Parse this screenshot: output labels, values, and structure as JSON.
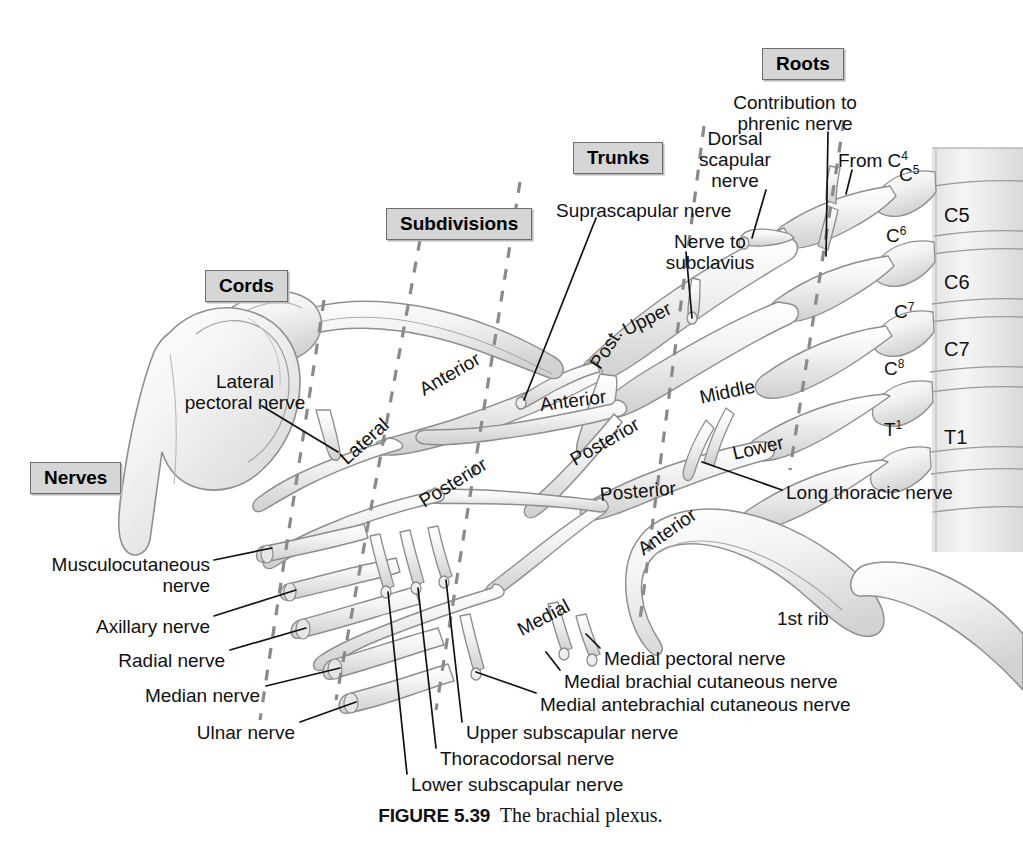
{
  "figure": {
    "number": "FIGURE 5.39",
    "title": "The brachial plexus.",
    "colors": {
      "box_fill": "#d6d6d6",
      "box_border": "#6e6e6e",
      "divider_dash": "#8a8a8a",
      "nerve_fill": "#efefef",
      "nerve_outline": "#8d8d8d",
      "bone_fill": "#f2f2f2",
      "leader_line": "#111111",
      "text": "#111111"
    }
  },
  "section_boxes": [
    {
      "label": "Nerves",
      "x": 30,
      "y": 462
    },
    {
      "label": "Cords",
      "x": 205,
      "y": 270
    },
    {
      "label": "Subdivisions",
      "x": 386,
      "y": 208
    },
    {
      "label": "Trunks",
      "x": 573,
      "y": 142
    },
    {
      "label": "Roots",
      "x": 762,
      "y": 48
    }
  ],
  "root_labels": [
    {
      "text": "C",
      "sup": "5",
      "x": 899,
      "y": 163
    },
    {
      "text": "C",
      "sup": "6",
      "x": 886,
      "y": 224
    },
    {
      "text": "C",
      "sup": "7",
      "x": 894,
      "y": 300
    },
    {
      "text": "C",
      "sup": "8",
      "x": 884,
      "y": 357
    },
    {
      "text": "T",
      "sup": "1",
      "x": 884,
      "y": 418
    }
  ],
  "vertebra_labels": [
    {
      "text": "C5",
      "x": 944,
      "y": 204
    },
    {
      "text": "C6",
      "x": 944,
      "y": 271
    },
    {
      "text": "C7",
      "x": 944,
      "y": 338
    },
    {
      "text": "T1",
      "x": 944,
      "y": 426
    }
  ],
  "nerve_labels": [
    {
      "text": "Contribution to\nphrenic nerve",
      "x": 795,
      "y": 92,
      "align": "center",
      "name": "contribution-to-phrenic-nerve-label"
    },
    {
      "text": "Dorsal\nscapular\nnerve",
      "x": 735,
      "y": 128,
      "align": "center",
      "name": "dorsal-scapular-nerve-label"
    },
    {
      "text": "From C4",
      "x": 838,
      "y": 146,
      "align": "left",
      "name": "from-c4-label"
    },
    {
      "text": "Suprascapular nerve",
      "x": 556,
      "y": 200,
      "align": "left",
      "name": "suprascapular-nerve-label"
    },
    {
      "text": "Nerve to\nsubclavius",
      "x": 659,
      "y": 231,
      "align": "left",
      "name": "nerve-to-subclavius-label"
    },
    {
      "text": "Lateral\npectoral nerve",
      "x": 192,
      "y": 371,
      "align": "left",
      "name": "lateral-pectoral-nerve-label"
    },
    {
      "text": "Long thoracic nerve",
      "x": 786,
      "y": 482,
      "align": "left",
      "name": "long-thoracic-nerve-label"
    },
    {
      "text": "1st rib",
      "x": 777,
      "y": 608,
      "align": "left",
      "name": "first-rib-label"
    },
    {
      "text": "Musculocutaneous\nnerve",
      "x": 205,
      "y": 554,
      "align": "right",
      "name": "musculocutaneous-nerve-label"
    },
    {
      "text": "Axillary nerve",
      "x": 205,
      "y": 616,
      "align": "right",
      "name": "axillary-nerve-label"
    },
    {
      "text": "Radial nerve",
      "x": 220,
      "y": 650,
      "align": "right",
      "name": "radial-nerve-label"
    },
    {
      "text": "Median nerve",
      "x": 255,
      "y": 685,
      "align": "right",
      "name": "median-nerve-label"
    },
    {
      "text": "Ulnar nerve",
      "x": 290,
      "y": 722,
      "align": "right",
      "name": "ulnar-nerve-label"
    },
    {
      "text": "Medial pectoral nerve",
      "x": 604,
      "y": 648,
      "align": "left",
      "name": "medial-pectoral-nerve-label"
    },
    {
      "text": "Medial brachial cutaneous nerve",
      "x": 564,
      "y": 671,
      "align": "left",
      "name": "medial-brachial-cutaneous-nerve-label"
    },
    {
      "text": "Medial antebrachial cutaneous nerve",
      "x": 540,
      "y": 694,
      "align": "left",
      "name": "medial-antebrachial-cutaneous-nerve-label"
    },
    {
      "text": "Upper subscapular nerve",
      "x": 466,
      "y": 722,
      "align": "left",
      "name": "upper-subscapular-nerve-label"
    },
    {
      "text": "Thoracodorsal nerve",
      "x": 440,
      "y": 748,
      "align": "left",
      "name": "thoracodorsal-nerve-label"
    },
    {
      "text": "Lower subscapular nerve",
      "x": 411,
      "y": 774,
      "align": "left",
      "name": "lower-subscapular-nerve-label"
    }
  ],
  "structure_labels": [
    {
      "text": "Upper",
      "x": 624,
      "y": 320,
      "rot": -27,
      "name": "upper-trunk-label"
    },
    {
      "text": "Middle",
      "x": 700,
      "y": 387,
      "rot": -12,
      "name": "middle-trunk-label"
    },
    {
      "text": "Lower",
      "x": 733,
      "y": 443,
      "rot": -13,
      "name": "lower-trunk-label"
    },
    {
      "text": "Anterior",
      "x": 421,
      "y": 380,
      "rot": -30,
      "name": "anterior-division-upper-label"
    },
    {
      "text": "Post.",
      "x": 595,
      "y": 356,
      "rot": -58,
      "name": "posterior-division-upper-label"
    },
    {
      "text": "Anterior",
      "x": 540,
      "y": 394,
      "rot": -7,
      "name": "anterior-division-middle-label"
    },
    {
      "text": "Posterior",
      "x": 572,
      "y": 450,
      "rot": -30,
      "name": "posterior-division-middle-label"
    },
    {
      "text": "Posterior",
      "x": 600,
      "y": 484,
      "rot": -5,
      "name": "posterior-division-lower-label"
    },
    {
      "text": "Anterior",
      "x": 640,
      "y": 540,
      "rot": -35,
      "name": "anterior-division-lower-label"
    },
    {
      "text": "Lateral",
      "x": 343,
      "y": 450,
      "rot": -42,
      "name": "lateral-cord-label"
    },
    {
      "text": "Posterior",
      "x": 421,
      "y": 492,
      "rot": -32,
      "name": "posterior-cord-label"
    },
    {
      "text": "Medial",
      "x": 519,
      "y": 620,
      "rot": -28,
      "name": "medial-cord-label"
    }
  ]
}
